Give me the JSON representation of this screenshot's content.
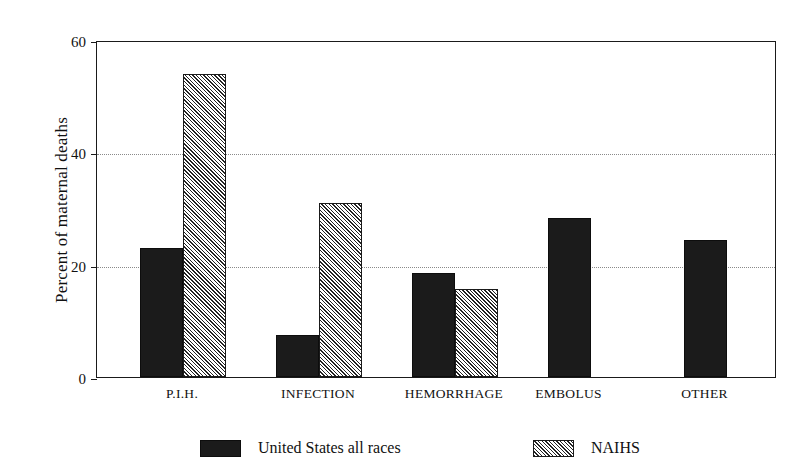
{
  "chart_data": {
    "type": "bar",
    "title": "",
    "subtitle": "",
    "xlabel": "",
    "ylabel": "Percent of maternal deaths",
    "categories": [
      "P.I.H.",
      "INFECTION",
      "HEMORRHAGE",
      "EMBOLUS",
      "OTHER"
    ],
    "series": [
      {
        "name": "United States all races",
        "fill": "solid-black",
        "color": "#1b1b1b",
        "values": [
          23,
          7.5,
          18.5,
          28.3,
          24.4
        ]
      },
      {
        "name": "NAIHS",
        "fill": "diagonal-hatch",
        "color": "#232323",
        "values": [
          54,
          31,
          15.7,
          null,
          null
        ]
      }
    ],
    "ylim": [
      0,
      60
    ],
    "yticks": [
      0,
      20,
      40,
      60
    ],
    "ytick_labels": [
      "0",
      "20",
      "40",
      "60"
    ],
    "grid": "horizontal-dotted",
    "legend_position": "bottom-center",
    "axis_color": "#1a1a1a",
    "gridline_color": "#8a8a8a",
    "background": "#ffffff"
  },
  "legend": {
    "entries": [
      {
        "label": "United States all races",
        "swatch": "solid"
      },
      {
        "label": "NAIHS",
        "swatch": "hatch"
      }
    ]
  }
}
